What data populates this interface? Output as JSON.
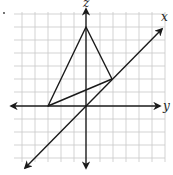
{
  "diagram": {
    "type": "3d-coordinate-sketch",
    "axes": {
      "z_label": "z",
      "x_label": "x",
      "y_label": "y"
    },
    "colors": {
      "grid": "#c8c8c8",
      "axes": "#1a1a1a",
      "triangle": "#1a1a1a",
      "background": "#ffffff"
    },
    "grid": {
      "spacing_px": 13,
      "columns": 12,
      "rows": 12
    },
    "triangle_vertices": [
      {
        "name": "top-vertex-on-z-axis",
        "px": [
          86,
          27
        ]
      },
      {
        "name": "left-vertex-on-y-axis",
        "px": [
          48,
          106
        ]
      },
      {
        "name": "right-vertex-on-x-axis",
        "px": [
          112,
          79
        ]
      }
    ],
    "marker": "·"
  }
}
